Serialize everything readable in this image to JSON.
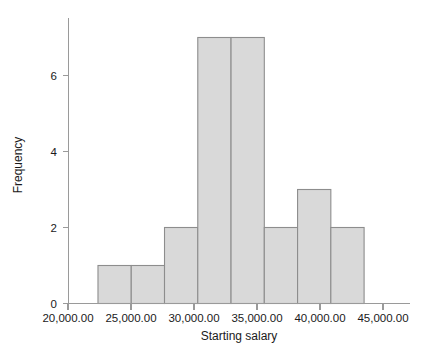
{
  "chart_data": {
    "type": "bar",
    "title": "",
    "xlabel": "Starting salary",
    "ylabel": "Frequency",
    "grid": false,
    "legend": false,
    "xlim": [
      20000,
      45000
    ],
    "ylim": [
      0,
      7.5
    ],
    "xticks": [
      20000,
      25000,
      30000,
      35000,
      40000,
      45000
    ],
    "xtick_labels": [
      "20,000.00",
      "25,000.00",
      "30,000.00",
      "35,000.00",
      "40,000.00",
      "45,000.00"
    ],
    "yticks": [
      0,
      2,
      4,
      6
    ],
    "ytick_labels": [
      "0",
      "2",
      "4",
      "6"
    ],
    "bin_edges": [
      22380,
      25020,
      27660,
      30300,
      32940,
      35580,
      38220,
      40860,
      43500
    ],
    "categories": [
      "22,380-25,020",
      "25,020-27,660",
      "27,660-30,300",
      "30,300-32,940",
      "32,940-35,580",
      "35,580-38,220",
      "38,220-40,860",
      "40,860-43,500"
    ],
    "values": [
      1,
      1,
      2,
      7,
      7,
      2,
      3,
      2
    ],
    "bar_fill_color": "#d9d9d9",
    "bar_edge_color": "#8d8d8d",
    "axis_color": "#9a9a9a",
    "text_color": "#1a1a1a"
  }
}
